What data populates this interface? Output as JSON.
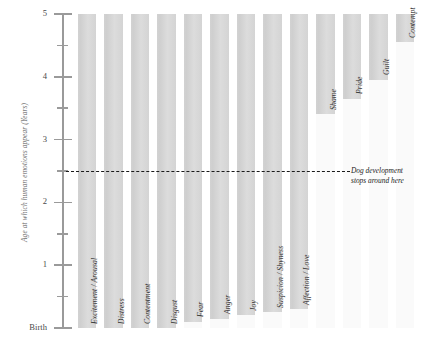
{
  "chart_data": {
    "type": "bar",
    "title": "",
    "subtitle": "",
    "xlabel": "",
    "ylabel": "Age at which human emotions appear (Years)",
    "ylim": [
      0,
      5
    ],
    "y_tick_labels": [
      "5",
      "4",
      "3",
      "2",
      "1",
      "Birth"
    ],
    "y_major_ticks": [
      5,
      4,
      3,
      2,
      1,
      0
    ],
    "y_minor_ticks": [
      4.5,
      3.5,
      2.5,
      1.5,
      0.5
    ],
    "grid": false,
    "legend": "none",
    "orientation": "vertical",
    "bar_meaning": "Each bar spans from the age the emotion first appears up to age 5 (top of scale)",
    "categories": [
      "Excitement / Arousal",
      "Distress",
      "Contentment",
      "Disgust",
      "Fear",
      "Anger",
      "Joy",
      "Suspicion / Shyness",
      "Affection / Love",
      "Shame",
      "Pride",
      "Guilt",
      "Contempt"
    ],
    "onset_ages": [
      0,
      0,
      0,
      0,
      0.1,
      0.15,
      0.2,
      0.25,
      0.3,
      3.4,
      3.65,
      3.95,
      4.55
    ],
    "values": [
      5,
      5,
      5,
      5,
      4.9,
      4.85,
      4.8,
      4.75,
      4.7,
      1.6,
      1.35,
      1.05,
      0.45
    ],
    "annotations": [
      {
        "name": "dog-development-threshold",
        "y": 2.5,
        "line_1": "Dog development",
        "line_2": "stops around here",
        "style": "dashed"
      }
    ],
    "colors": {
      "bar_fill": "#d6d6d6",
      "background_column": "#fafafa",
      "axis": "#9a9a9a",
      "label_text": "#2f2f2f",
      "threshold_line": "#1a1a1a"
    }
  },
  "axis": {
    "y_label": "Age at which human emotions appear (Years)",
    "ticks": [
      {
        "label": "5"
      },
      {
        "label": "4"
      },
      {
        "label": "3"
      },
      {
        "label": "2"
      },
      {
        "label": "1"
      },
      {
        "label": "Birth"
      }
    ]
  },
  "bars": [
    {
      "label": "Excitement / Arousal"
    },
    {
      "label": "Distress"
    },
    {
      "label": "Contentment"
    },
    {
      "label": "Disgust"
    },
    {
      "label": "Fear"
    },
    {
      "label": "Anger"
    },
    {
      "label": "Joy"
    },
    {
      "label": "Suspicion / Shyness"
    },
    {
      "label": "Affection / Love"
    },
    {
      "label": "Shame"
    },
    {
      "label": "Pride"
    },
    {
      "label": "Guilt"
    },
    {
      "label": "Contempt"
    }
  ],
  "threshold": {
    "line_1": "Dog development",
    "line_2": "stops around here"
  }
}
